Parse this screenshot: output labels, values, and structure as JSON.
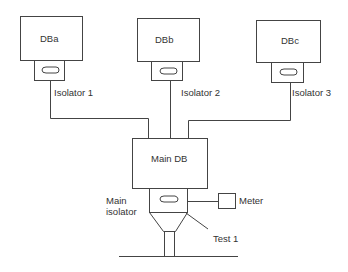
{
  "diagram": {
    "sub_boards": [
      {
        "label": "DBa",
        "isolator_label": "Isolator 1"
      },
      {
        "label": "DBb",
        "isolator_label": "Isolator 2"
      },
      {
        "label": "DBc",
        "isolator_label": "Isolator 3"
      }
    ],
    "main_board": {
      "label": "Main DB"
    },
    "main_isolator": {
      "label_line1": "Main",
      "label_line2": "isolator"
    },
    "meter": {
      "label": "Meter"
    },
    "test_point": {
      "label": "Test 1"
    },
    "colors": {
      "stroke": "#444444",
      "text": "#333333",
      "background": "#ffffff"
    }
  }
}
